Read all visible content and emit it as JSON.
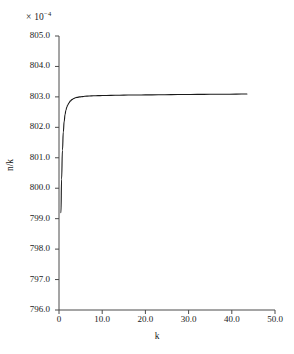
{
  "chart_data": {
    "type": "line",
    "title": "",
    "subtitle": "",
    "xlabel": "k",
    "ylabel": "n/k",
    "y_multiplier_label": "× 10",
    "y_multiplier_exponent": "−4",
    "xlim": [
      0,
      50
    ],
    "ylim": [
      796.0,
      805.0
    ],
    "grid": false,
    "legend": null,
    "xticks": [
      0,
      10,
      20,
      30,
      40,
      50
    ],
    "xtick_labels": [
      "0",
      "10.0",
      "20.0",
      "30.0",
      "40.0",
      "50.0"
    ],
    "yticks": [
      796.0,
      797.0,
      798.0,
      799.0,
      800.0,
      801.0,
      802.0,
      803.0,
      804.0,
      805.0
    ],
    "ytick_labels": [
      "796.0",
      "797.0",
      "798.0",
      "799.0",
      "800.0",
      "801.0",
      "802.0",
      "803.0",
      "804.0",
      "805.0"
    ],
    "line_color": "#1a1a1a",
    "line_width": 1.1,
    "series": [
      {
        "name": "n/k",
        "x": [
          0.45,
          0.6,
          0.8,
          1.0,
          1.2,
          1.4,
          1.6,
          1.8,
          2.0,
          2.3,
          2.6,
          3.0,
          3.4,
          3.8,
          4.2,
          4.8,
          5.4,
          6.0,
          7.0,
          8.0,
          9.0,
          10.0,
          12.0,
          14.0,
          16.0,
          18.0,
          20.0,
          23.0,
          26.0,
          29.0,
          32.0,
          35.0,
          38.0,
          41.0,
          43.5
        ],
        "y": [
          799.2,
          800.3,
          801.25,
          801.85,
          802.2,
          802.42,
          802.56,
          802.66,
          802.73,
          802.8,
          802.86,
          802.91,
          802.945,
          802.97,
          802.985,
          803.0,
          803.01,
          803.02,
          803.03,
          803.035,
          803.04,
          803.045,
          803.05,
          803.055,
          803.06,
          803.062,
          803.065,
          803.07,
          803.075,
          803.078,
          803.082,
          803.085,
          803.088,
          803.09,
          803.095
        ]
      }
    ]
  },
  "axes": {
    "y_exponent_prefix": "× 10",
    "y_exponent_value": "−4"
  }
}
